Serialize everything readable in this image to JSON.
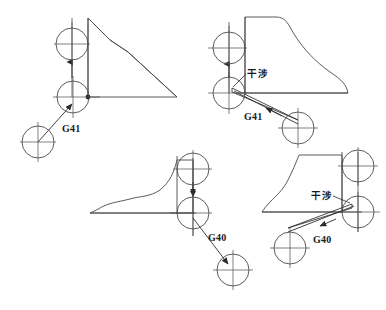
{
  "figure": {
    "title": "",
    "background_color": "#ffffff",
    "line_color": "#4a4a4a",
    "dark_line_color": "#2b2b2b",
    "text_color": "#1a1a1a"
  },
  "labels": {
    "g41_top_left": "G41",
    "g41_top_right": "G41",
    "g40_bottom_left": "G40",
    "g40_bottom_right": "G40",
    "interference_top_right": "干涉",
    "interference_bottom_right": "干涉"
  },
  "panels": [
    {
      "id": "top-left",
      "name": "g41-startup-no-interference",
      "code": "G41",
      "interference": false,
      "tool_circles": [
        {
          "name": "tool-circle-end",
          "cx": 72,
          "cy": 44,
          "r": 16
        },
        {
          "name": "tool-circle-mid",
          "cx": 73,
          "cy": 97,
          "r": 16
        },
        {
          "name": "tool-circle-start",
          "cx": 38,
          "cy": 142,
          "r": 16
        }
      ],
      "label_positions": [
        {
          "text_key": "g41_top_left",
          "x": 62,
          "y": 123
        }
      ]
    },
    {
      "id": "top-right",
      "name": "g41-startup-with-interference",
      "code": "G41",
      "interference": true,
      "tool_circles": [
        {
          "name": "tool-circle-end",
          "cx": 229,
          "cy": 48,
          "r": 16
        },
        {
          "name": "tool-circle-mid",
          "cx": 229,
          "cy": 93,
          "r": 16
        },
        {
          "name": "tool-circle-start",
          "cx": 298,
          "cy": 128,
          "r": 16
        }
      ],
      "label_positions": [
        {
          "text_key": "g41_top_right",
          "x": 244,
          "y": 111
        },
        {
          "text_key": "interference_top_right",
          "x": 247,
          "y": 68
        }
      ]
    },
    {
      "id": "bottom-left",
      "name": "g40-cancel-no-interference",
      "code": "G40",
      "interference": false,
      "tool_circles": [
        {
          "name": "tool-circle-start",
          "cx": 193,
          "cy": 169,
          "r": 16
        },
        {
          "name": "tool-circle-mid",
          "cx": 193,
          "cy": 213,
          "r": 16
        },
        {
          "name": "tool-circle-end",
          "cx": 233,
          "cy": 270,
          "r": 16
        }
      ],
      "label_positions": [
        {
          "text_key": "g40_bottom_left",
          "x": 208,
          "y": 238
        }
      ]
    },
    {
      "id": "bottom-right",
      "name": "g40-cancel-with-interference",
      "code": "G40",
      "interference": true,
      "tool_circles": [
        {
          "name": "tool-circle-start",
          "cx": 358,
          "cy": 166,
          "r": 16
        },
        {
          "name": "tool-circle-mid",
          "cx": 358,
          "cy": 212,
          "r": 16
        },
        {
          "name": "tool-circle-end",
          "cx": 290,
          "cy": 248,
          "r": 16
        }
      ],
      "label_positions": [
        {
          "text_key": "g40_bottom_right",
          "x": 313,
          "y": 238
        },
        {
          "text_key": "interference_bottom_right",
          "x": 312,
          "y": 190
        }
      ]
    }
  ]
}
